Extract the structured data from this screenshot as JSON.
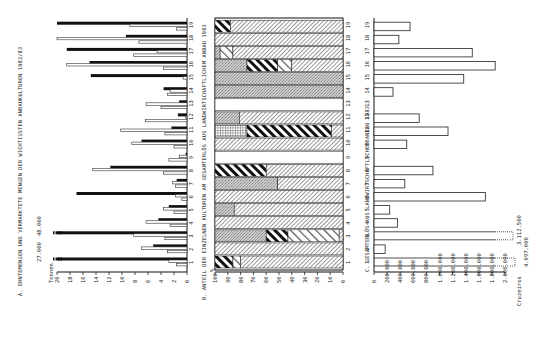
{
  "figure": {
    "orientation": "rotated-90-ccw",
    "background": "#ffffff",
    "ink": "#111111"
  },
  "chart_data": [
    {
      "id": "A",
      "type": "bar",
      "title": "A. ERNTEMENGEN UND VERMARKTETE MENGEN DER WICHTIGSTEN ANBAUKULTUREN 1982/83",
      "xlabel": "",
      "ylabel": "Tonnen",
      "unit": "Tonnen",
      "ylim": [
        0,
        20
      ],
      "ticks": [
        "0",
        "2",
        "4",
        "6",
        "8",
        "10",
        "12",
        "14",
        "16",
        "18",
        "20"
      ],
      "categories": [
        "1",
        "2",
        "3",
        "4",
        "5",
        "6",
        "7",
        "8",
        "9",
        "10",
        "11",
        "12",
        "13",
        "14",
        "15",
        "16",
        "17",
        "18",
        "19"
      ],
      "series": [
        {
          "name": "Erntemenge (weiss)",
          "values": [
            2.8,
            7.0,
            8.2,
            6.3,
            3.6,
            1.8,
            2.2,
            14.5,
            1.2,
            8.5,
            10.2,
            0.2,
            6.3,
            2.6,
            0.6,
            18.5,
            4.6,
            21.5,
            8.8
          ]
        },
        {
          "name": "Vermarktete Menge (schwarz)",
          "values": [
            27.0,
            5.2,
            48.0,
            4.4,
            2.8,
            17.0,
            1.6,
            11.8,
            0.2,
            7.0,
            2.4,
            1.4,
            1.2,
            3.6,
            14.8,
            15.0,
            18.5,
            9.4,
            20.0
          ]
        },
        {
          "name": "Verkauf Nebenbalken",
          "values": [
            1.6,
            3.0,
            3.4,
            2.6,
            2.0,
            0.8,
            1.8,
            3.6,
            2.8,
            2.0,
            3.4,
            6.4,
            4.0,
            3.0,
            0,
            3.6,
            8.2,
            7.4,
            1.6
          ]
        }
      ],
      "annotations": [
        "27.000",
        "48.000"
      ],
      "legend_position": "none",
      "grid": false
    },
    {
      "id": "B",
      "type": "bar",
      "stacked": true,
      "title": "B. ANTEIL DER EINZELNEN KULTUREN AM GESAMTERLÖS AUS LANDWIRTSCHAFTLICHEM ANBAU 1983",
      "xlabel": "",
      "ylabel": "%",
      "ylim": [
        0,
        100
      ],
      "ticks": [
        "100",
        "90",
        "80",
        "70",
        "60",
        "50",
        "40",
        "30",
        "20",
        "10",
        "0"
      ],
      "categories": [
        "1",
        "2",
        "3",
        "4",
        "5",
        "6",
        "7",
        "8",
        "9",
        "10",
        "11",
        "12",
        "13",
        "14",
        "15",
        "16",
        "17",
        "18",
        "19"
      ],
      "segments": [
        [
          {
            "pattern": "bold-hatch",
            "value": 14
          },
          {
            "pattern": "light-hatch",
            "value": 6
          },
          {
            "pattern": "fine-hatch",
            "value": 80
          }
        ],
        [
          {
            "pattern": "fine-hatch",
            "value": 100
          }
        ],
        [
          {
            "pattern": "stipple",
            "value": 40
          },
          {
            "pattern": "bold-hatch",
            "value": 17
          },
          {
            "pattern": "light-hatch",
            "value": 40
          },
          {
            "pattern": "fine-hatch",
            "value": 3
          }
        ],
        [
          {
            "pattern": "fine-hatch",
            "value": 100
          }
        ],
        [
          {
            "pattern": "stipple",
            "value": 15
          },
          {
            "pattern": "fine-hatch",
            "value": 85
          }
        ],
        [
          {
            "pattern": "fine-hatch",
            "value": 100
          }
        ],
        [
          {
            "pattern": "stipple",
            "value": 49
          },
          {
            "pattern": "fine-hatch",
            "value": 51
          }
        ],
        [
          {
            "pattern": "bold-hatch",
            "value": 40
          },
          {
            "pattern": "fine-hatch",
            "value": 60
          }
        ],
        [
          {
            "pattern": "blank",
            "value": 100
          }
        ],
        [
          {
            "pattern": "fine-hatch",
            "value": 100
          }
        ],
        [
          {
            "pattern": "grid",
            "value": 25
          },
          {
            "pattern": "bold-hatch",
            "value": 66
          },
          {
            "pattern": "fine-hatch",
            "value": 9
          }
        ],
        [
          {
            "pattern": "stipple",
            "value": 19
          },
          {
            "pattern": "fine-hatch",
            "value": 81
          }
        ],
        [
          {
            "pattern": "blank",
            "value": 100
          }
        ],
        [
          {
            "pattern": "stipple",
            "value": 100
          }
        ],
        [
          {
            "pattern": "stipple",
            "value": 100
          }
        ],
        [
          {
            "pattern": "stipple",
            "value": 25
          },
          {
            "pattern": "bold-hatch",
            "value": 24
          },
          {
            "pattern": "light-hatch",
            "value": 11
          },
          {
            "pattern": "fine-hatch",
            "value": 40
          }
        ],
        [
          {
            "pattern": "stipple",
            "value": 4
          },
          {
            "pattern": "light-hatch",
            "value": 10
          },
          {
            "pattern": "fine-hatch",
            "value": 86
          }
        ],
        [
          {
            "pattern": "fine-hatch",
            "value": 100
          }
        ],
        [
          {
            "pattern": "bold-hatch",
            "value": 12
          },
          {
            "pattern": "fine-hatch",
            "value": 88
          }
        ]
      ],
      "legend_position": "none",
      "grid": false
    },
    {
      "id": "C",
      "type": "bar",
      "title": "C. GESAMTERLÖS AUS LANDWIRTSCHAFTLICHEM ANBAU 1983",
      "xlabel": "",
      "ylabel": "Cruzeiros",
      "unit": "Cruzeiros",
      "ylim": [
        0,
        2000000
      ],
      "ticks": [
        "0",
        "200.000",
        "400.000",
        "600.000",
        "800.000",
        "1.000.000",
        "1.200.000",
        "1.400.000",
        "1.600.000",
        "1.800.000",
        "2.000.000"
      ],
      "categories": [
        "1",
        "2",
        "3",
        "4",
        "5",
        "6",
        "7",
        "8",
        "9",
        "10",
        "11",
        "12",
        "13",
        "14",
        "15",
        "16",
        "17",
        "18",
        "19"
      ],
      "values": [
        4097000,
        170000,
        3112500,
        360000,
        240000,
        1700000,
        470000,
        900000,
        0,
        500000,
        1130000,
        690000,
        0,
        290000,
        1370000,
        1850000,
        1500000,
        380000,
        550000
      ],
      "annotations": [
        "3.112.500",
        "4.097.000"
      ],
      "legend_position": "none",
      "grid": false
    }
  ],
  "labels": {
    "a_title": "A. ERNTEMENGEN UND VERMARKTETE MENGEN DER WICHTIGSTEN ANBAUKULTUREN 1982/83",
    "a_unit": "Tonnen",
    "a_break1": "27.000",
    "a_break2": "48.000",
    "b_title": "B. ANTEIL DER EINZELNEN KULTUREN AM GESAMTERLÖS AUS LANDWIRTSCHAFTLICHEM ANBAU 1983",
    "b_unit": "%",
    "c_title": "C. GESAMTERLÖS AUS LANDWIRTSCHAFTLICHEM ANBAU 1983",
    "c_unit": "Cruzeiros",
    "c_break1": "3.112.500",
    "c_break2": "4.097.000"
  }
}
